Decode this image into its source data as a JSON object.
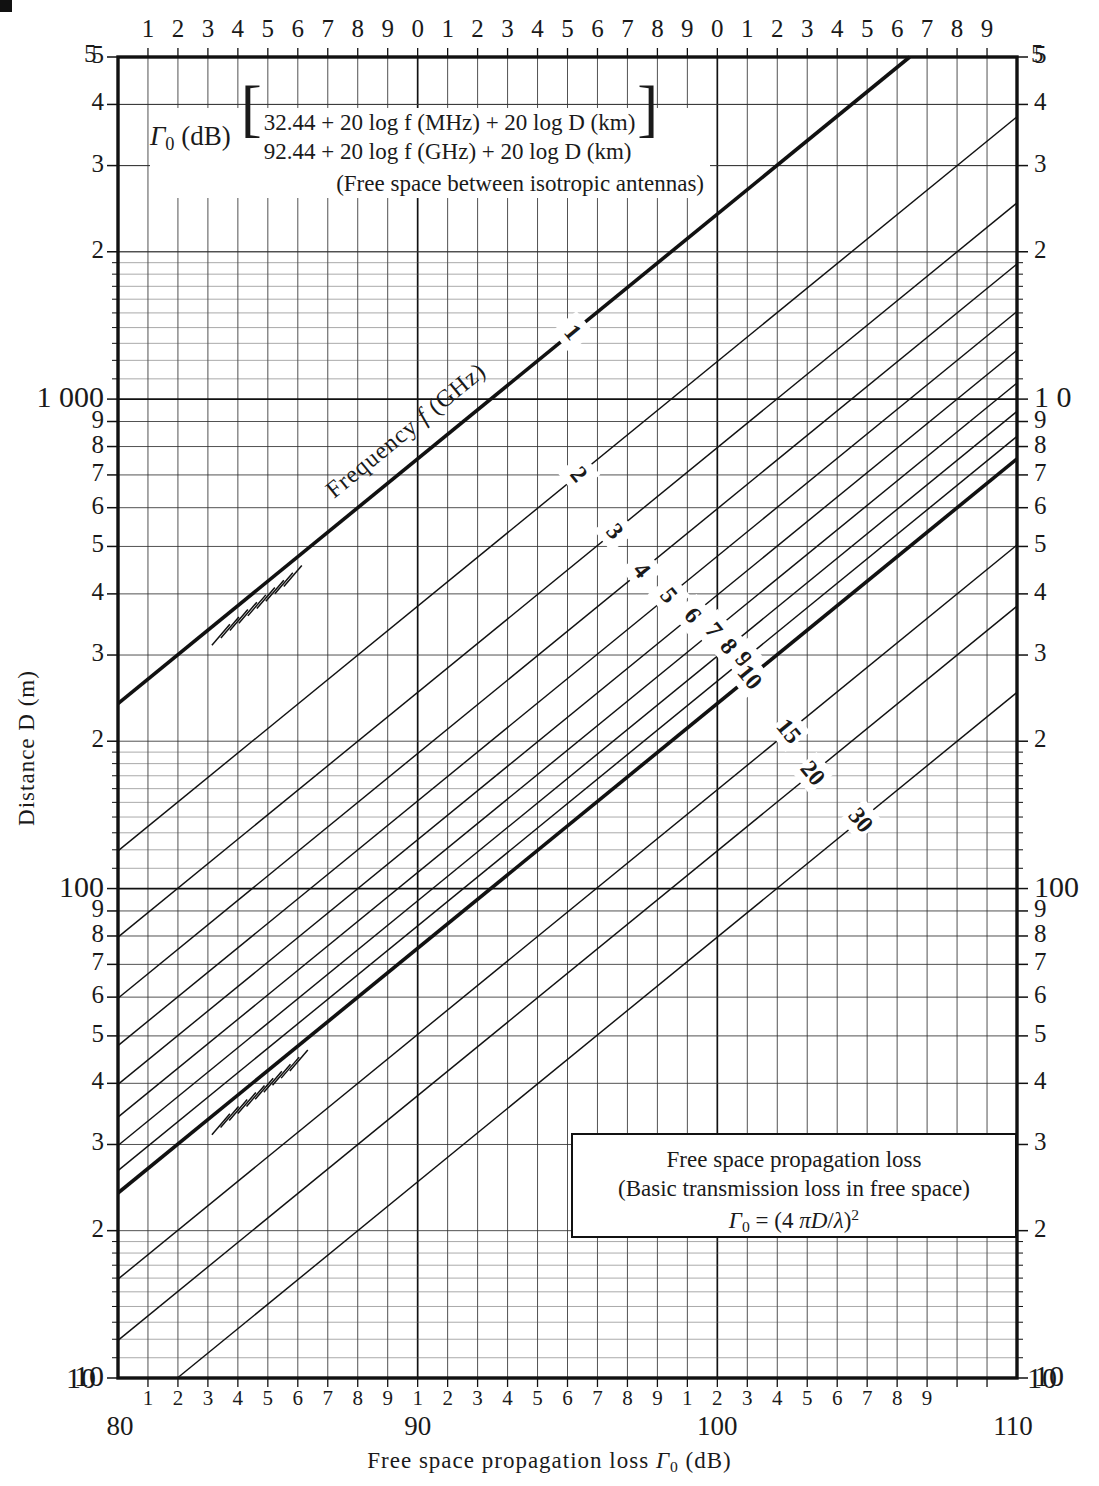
{
  "chart_data": {
    "type": "line",
    "title": "Free space propagation loss",
    "subtitle": "(Basic transmission loss in free space)",
    "formula_main": "Γ₀ = (4 πD/λ)²",
    "xlabel": "Free space propagation loss Γ₀ (dB)",
    "ylabel": "Distance D (m)",
    "ylabel_right": "Distance D (km)",
    "xlim": [
      80,
      110
    ],
    "ylim": [
      10,
      5000
    ],
    "xscale": "linear-db",
    "yscale": "log",
    "grid": true,
    "series_label": "Frequency f (GHz)",
    "series": [
      {
        "name": "1",
        "freq_ghz": 1,
        "style": "heavy"
      },
      {
        "name": "2",
        "freq_ghz": 2,
        "style": "thin"
      },
      {
        "name": "3",
        "freq_ghz": 3,
        "style": "thin"
      },
      {
        "name": "4",
        "freq_ghz": 4,
        "style": "thin"
      },
      {
        "name": "5",
        "freq_ghz": 5,
        "style": "thin"
      },
      {
        "name": "6",
        "freq_ghz": 6,
        "style": "thin"
      },
      {
        "name": "7",
        "freq_ghz": 7,
        "style": "thin"
      },
      {
        "name": "8",
        "freq_ghz": 8,
        "style": "thin"
      },
      {
        "name": "9",
        "freq_ghz": 9,
        "style": "thin"
      },
      {
        "name": "10",
        "freq_ghz": 10,
        "style": "heavy"
      },
      {
        "name": "15",
        "freq_ghz": 15,
        "style": "thin"
      },
      {
        "name": "20",
        "freq_ghz": 20,
        "style": "thin"
      },
      {
        "name": "30",
        "freq_ghz": 30,
        "style": "thin"
      }
    ],
    "x_major_ticks": [
      80,
      90,
      100,
      110
    ],
    "x_minor_ticks": [
      81,
      82,
      83,
      84,
      85,
      86,
      87,
      88,
      89,
      91,
      92,
      93,
      94,
      95,
      96,
      97,
      98,
      99,
      101,
      102,
      103,
      104,
      105,
      106,
      107,
      108,
      109
    ],
    "y_major_decades": [
      10,
      100,
      1000
    ],
    "annotation": "Free space between isotropic antennas"
  },
  "axes": {
    "top": {
      "labels": [
        "1",
        "2",
        "3",
        "4",
        "5",
        "6",
        "7",
        "8",
        "9",
        "0",
        "1",
        "2",
        "3",
        "4",
        "5",
        "6",
        "7",
        "8",
        "9",
        "0",
        "1",
        "2",
        "3",
        "4",
        "5",
        "6",
        "7",
        "8",
        "9"
      ],
      "corner_left": "5",
      "corner_right": "5"
    },
    "bottom": {
      "minor_labels": [
        "1",
        "2",
        "3",
        "4",
        "5",
        "6",
        "7",
        "8",
        "9",
        "1",
        "2",
        "3",
        "4",
        "5",
        "6",
        "7",
        "8",
        "9",
        "1",
        "2",
        "3",
        "4",
        "5",
        "6",
        "7",
        "8",
        "9"
      ],
      "major_labels": [
        "80",
        "90",
        "100",
        "110"
      ],
      "corner_left": "10",
      "corner_right": "10",
      "title": "Free space propagation loss Γ₀ (dB)"
    },
    "left": {
      "title": "Distance D (m)",
      "labels": [
        "5",
        "4",
        "3",
        "2",
        "1 000",
        "9",
        "8",
        "7",
        "6",
        "5",
        "4",
        "3",
        "2",
        "100",
        "9",
        "8",
        "7",
        "6",
        "5",
        "4",
        "3",
        "2",
        "10"
      ]
    },
    "right": {
      "labels": [
        "5",
        "4",
        "3",
        "2",
        "1 0",
        "9",
        "8",
        "7",
        "6",
        "5",
        "4",
        "3",
        "2",
        "100",
        "9",
        "8",
        "7",
        "6",
        "5",
        "4",
        "3",
        "2",
        "10"
      ]
    }
  },
  "formula_box": {
    "lhs": "Γ₀ (dB)",
    "line1": "32.44 + 20 log f (MHz) + 20 log D (km)",
    "line2": "92.44 + 20 log f (GHz) + 20 log D (km)",
    "note": "(Free space between isotropic antennas)"
  },
  "legend_box": {
    "line1": "Free space propagation loss",
    "line2": "(Basic transmission loss in free space)",
    "line3": "Γ₀ = (4 πD/λ)²"
  },
  "curve_label": "Frequency f (GHz)",
  "colors": {
    "ink": "#1a1a1a",
    "grid_minor": "#2b2b2b",
    "grid_major": "#111111",
    "background": "#ffffff"
  }
}
